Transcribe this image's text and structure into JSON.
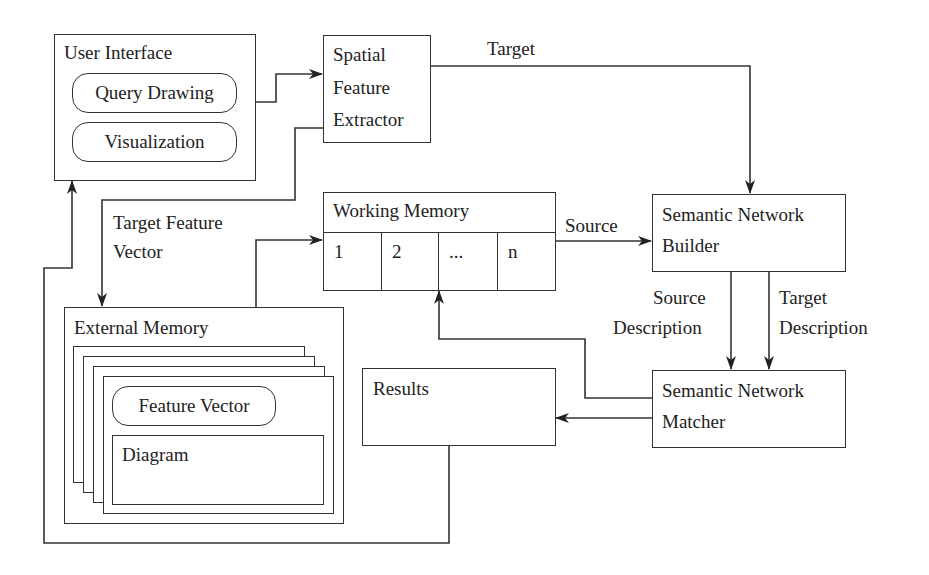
{
  "diagram": {
    "user_interface": {
      "title": "User Interface",
      "query_drawing": "Query Drawing",
      "visualization": "Visualization"
    },
    "spatial_feature_extractor": {
      "line1": "Spatial",
      "line2": "Feature",
      "line3": "Extractor"
    },
    "working_memory": {
      "title": "Working Memory",
      "cells": [
        "1",
        "2",
        "...",
        "n"
      ]
    },
    "semantic_network_builder": {
      "line1": "Semantic Network",
      "line2": "Builder"
    },
    "semantic_network_matcher": {
      "line1": "Semantic Network",
      "line2": "Matcher"
    },
    "results": {
      "title": "Results"
    },
    "external_memory": {
      "title": "External Memory",
      "feature_vector": "Feature Vector",
      "diagram": "Diagram"
    },
    "edge_labels": {
      "target": "Target",
      "target_feature_vector_1": "Target Feature",
      "target_feature_vector_2": "Vector",
      "source": "Source",
      "source_description_1": "Source",
      "source_description_2": "Description",
      "target_description_1": "Target",
      "target_description_2": "Description"
    }
  }
}
